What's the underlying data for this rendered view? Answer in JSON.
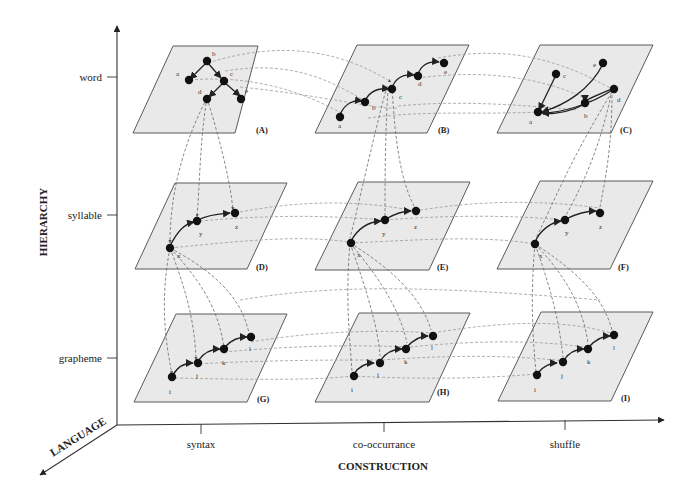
{
  "axes": {
    "hierarchy": {
      "label": "HIERARCHY",
      "ticks": [
        "word",
        "syllable",
        "grapheme"
      ]
    },
    "construction": {
      "label": "CONSTRUCTION",
      "ticks": [
        "syntax",
        "co-occurrance",
        "shuffle"
      ]
    },
    "language": {
      "label": "LANGUAGE"
    }
  },
  "panels": [
    {
      "id": "A",
      "label": "(A)",
      "level": "word",
      "construction": "syntax",
      "nodes": [
        "a",
        "b",
        "c",
        "d",
        "e"
      ]
    },
    {
      "id": "B",
      "label": "(B)",
      "level": "word",
      "construction": "co-occurrance",
      "nodes": [
        "a",
        "b",
        "c",
        "d",
        "e"
      ]
    },
    {
      "id": "C",
      "label": "(C)",
      "level": "word",
      "construction": "shuffle",
      "nodes": [
        "a",
        "b",
        "c",
        "d",
        "e"
      ]
    },
    {
      "id": "D",
      "label": "(D)",
      "level": "syllable",
      "construction": "syntax",
      "nodes": [
        "x",
        "y",
        "z"
      ]
    },
    {
      "id": "E",
      "label": "(E)",
      "level": "syllable",
      "construction": "co-occurrance",
      "nodes": [
        "x",
        "y",
        "z"
      ]
    },
    {
      "id": "F",
      "label": "(F)",
      "level": "syllable",
      "construction": "shuffle",
      "nodes": [
        "x",
        "y",
        "z"
      ]
    },
    {
      "id": "G",
      "label": "(G)",
      "level": "grapheme",
      "construction": "syntax",
      "nodes": [
        "i",
        "j",
        "k",
        "l"
      ]
    },
    {
      "id": "H",
      "label": "(H)",
      "level": "grapheme",
      "construction": "co-occurrance",
      "nodes": [
        "i",
        "j",
        "k",
        "l"
      ]
    },
    {
      "id": "I",
      "label": "(I)",
      "level": "grapheme",
      "construction": "shuffle",
      "nodes": [
        "i",
        "j",
        "k",
        "l"
      ]
    }
  ],
  "node_labels": {
    "A": [
      "a",
      "b",
      "c",
      "d",
      "e"
    ],
    "B": [
      "a",
      "b",
      "c",
      "d",
      "e"
    ],
    "C": [
      "a",
      "b",
      "c",
      "d",
      "e"
    ],
    "D": [
      "x",
      "y",
      "z"
    ],
    "E": [
      "x",
      "y",
      "z"
    ],
    "F": [
      "x",
      "y",
      "z"
    ],
    "G": [
      "i",
      "j",
      "k",
      "l"
    ],
    "H": [
      "i",
      "j",
      "k",
      "l"
    ],
    "I": [
      "i",
      "j",
      "k",
      "l"
    ]
  }
}
